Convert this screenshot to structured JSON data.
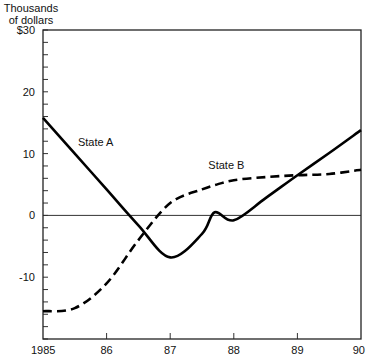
{
  "chart_data": {
    "type": "line",
    "title": "",
    "ylabel": "Thousands of dollars",
    "xlabel": "",
    "ylim": [
      -20,
      30
    ],
    "xlim": [
      1985,
      1990
    ],
    "grid": false,
    "zero_line": true,
    "x_tick_labels": [
      "1985",
      "86",
      "87",
      "88",
      "89",
      "90"
    ],
    "y_tick_labels": [
      "$30",
      "20",
      "10",
      "0",
      "-10"
    ],
    "x": [
      1985,
      1985.5,
      1986,
      1986.5,
      1987,
      1987.5,
      1987.7,
      1988,
      1988.5,
      1989,
      1989.5,
      1990
    ],
    "series": [
      {
        "name": "State A",
        "style": "solid",
        "values": [
          15.8,
          10.0,
          4.2,
          -1.6,
          -6.8,
          -3.0,
          0.5,
          -0.8,
          2.8,
          6.5,
          10.1,
          13.8
        ]
      },
      {
        "name": "State B",
        "style": "dashed",
        "values": [
          -15.5,
          -15.0,
          -11.0,
          -4.0,
          2.0,
          4.2,
          4.9,
          5.7,
          6.2,
          6.5,
          6.7,
          7.4
        ]
      }
    ],
    "annotations": [
      {
        "text": "State A",
        "x": 1985.55,
        "y": 11.3
      },
      {
        "text": "State B",
        "x": 1987.6,
        "y": 7.5
      }
    ]
  },
  "axis": {
    "unit_line1": "Thousands",
    "unit_line2": "of dollars"
  }
}
